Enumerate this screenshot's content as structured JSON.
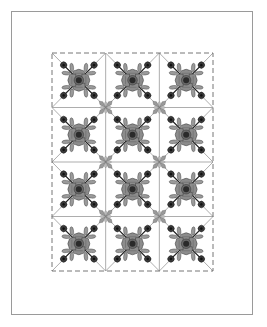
{
  "diagram": {
    "type": "quilt-layout",
    "frame": {
      "x": 11,
      "y": 11,
      "w": 242,
      "h": 304,
      "stroke": "#9a9a9a"
    },
    "grid": {
      "x": 52,
      "y": 53,
      "w": 161,
      "h": 218,
      "cols": 3,
      "rows": 4,
      "border_style": "dashed",
      "line_color": "#8a8a8a"
    },
    "block_motif": {
      "name": "floral-applique",
      "center_color": "#2a2a2a",
      "petal_color": "#8c8c8c",
      "leaf_color": "#9a9a9a",
      "bud_color": "#3a3a3a",
      "stem_color": "#222222",
      "outline_color": "#333333"
    },
    "connector": {
      "name": "star-connector",
      "color": "#9a9a9a"
    }
  }
}
